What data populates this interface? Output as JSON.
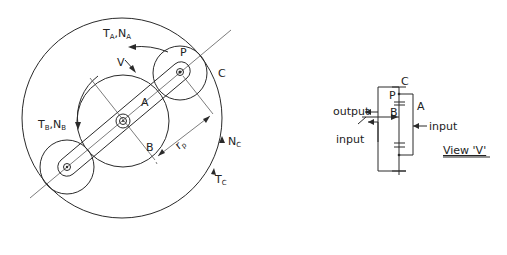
{
  "figure": {
    "main_view": {
      "labels": {
        "ta_na": "T",
        "ta_sub": "A",
        "ta_sep": ",N",
        "na_sub": "A",
        "v": "V",
        "p": "P",
        "c": "C",
        "a": "A",
        "b": "B",
        "tb": "T",
        "tb_sub": "B",
        "tb_sep": ",N",
        "nb_sub": "B",
        "rp": "r",
        "rp_sub": "p",
        "nc": "N",
        "nc_sub": "C",
        "tc": "T",
        "tc_sub": "C"
      }
    },
    "view_v": {
      "labels": {
        "c": "C",
        "p": "P",
        "a": "A",
        "b": "B",
        "output": "output",
        "input_left": "input",
        "input_right": "input",
        "caption": "View 'V'"
      }
    }
  },
  "colors": {
    "ink": "#2a2a2a",
    "background": "#ffffff"
  }
}
